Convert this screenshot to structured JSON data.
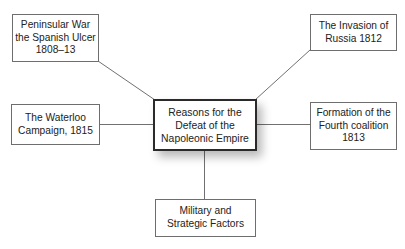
{
  "diagram": {
    "type": "spider / mind map",
    "center": {
      "label": "Reasons for the\nDefeat of the\nNapoleonic Empire"
    },
    "nodes": [
      {
        "id": "peninsular",
        "label": "Peninsular War\nthe Spanish Ulcer\n1808–13",
        "position": "top-left"
      },
      {
        "id": "russia",
        "label": "The Invasion of\nRussia 1812",
        "position": "top-right"
      },
      {
        "id": "waterloo",
        "label": "The Waterloo\nCampaign, 1815",
        "position": "left"
      },
      {
        "id": "coalition",
        "label": "Formation of the\nFourth coalition\n1813",
        "position": "right"
      },
      {
        "id": "military",
        "label": "Military and\nStrategic Factors",
        "position": "bottom"
      }
    ],
    "colors": {
      "background": "#ffffff",
      "node_border": "#6e6e6e",
      "center_border": "#2a2a2a",
      "connector": "#707070",
      "text": "#222222"
    }
  }
}
